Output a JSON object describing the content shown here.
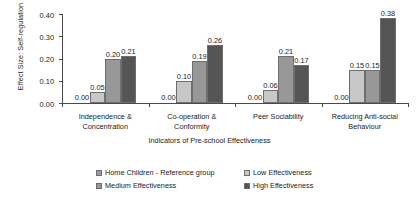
{
  "chart_data": {
    "type": "bar",
    "title": "",
    "subtitle": "",
    "xlabel": "Indicators of Pre-school Effectiveness",
    "ylabel": "Effect Size: Self-regulation",
    "categories": [
      "Independence & Concentration",
      "Co-operation & Conformity",
      "Peer Sociability",
      "Reducing Anti-social Behaviour"
    ],
    "category_lines": [
      [
        "Independence &",
        "Concentration"
      ],
      [
        "Co-operation &",
        "Conformity"
      ],
      [
        "Peer Sociability"
      ],
      [
        "Reducing Anti-social",
        "Behaviour"
      ]
    ],
    "series": [
      {
        "name": "Home Children - Reference group",
        "color": "#9a9a9a",
        "values": [
          0.0,
          0.0,
          0.0,
          0.0
        ],
        "labels": [
          "0.00",
          "0.00",
          "0.00",
          "0.00"
        ]
      },
      {
        "name": "Low Effectiveness",
        "color": "#c8c8c8",
        "values": [
          0.05,
          0.1,
          0.06,
          0.15
        ],
        "labels": [
          "0.05",
          "0.10",
          "0.06",
          "0.15"
        ]
      },
      {
        "name": "Medium Effectiveness",
        "color": "#989898",
        "values": [
          0.2,
          0.19,
          0.21,
          0.15
        ],
        "labels": [
          "0.20",
          "0.19",
          "0.21",
          "0.15"
        ]
      },
      {
        "name": "High Effectiveness",
        "color": "#555555",
        "values": [
          0.21,
          0.26,
          0.17,
          0.38
        ],
        "labels": [
          "0.21",
          "0.26",
          "0.17",
          "0.38"
        ]
      }
    ],
    "ylim": [
      0.0,
      0.4
    ],
    "ytick_values": [
      0.0,
      0.1,
      0.2,
      0.3,
      0.4
    ],
    "ytick_labels": [
      "0.00",
      "0.10",
      "0.20",
      "0.30",
      "0.40"
    ],
    "grid": false,
    "legend_position": "bottom"
  },
  "legend": {
    "items": [
      {
        "label": "Home Children - Reference group",
        "color": "#9a9a9a"
      },
      {
        "label": "Low Effectiveness",
        "color": "#c8c8c8"
      },
      {
        "label": "Medium Effectiveness",
        "color": "#989898"
      },
      {
        "label": "High Effectiveness",
        "color": "#555555"
      }
    ]
  }
}
